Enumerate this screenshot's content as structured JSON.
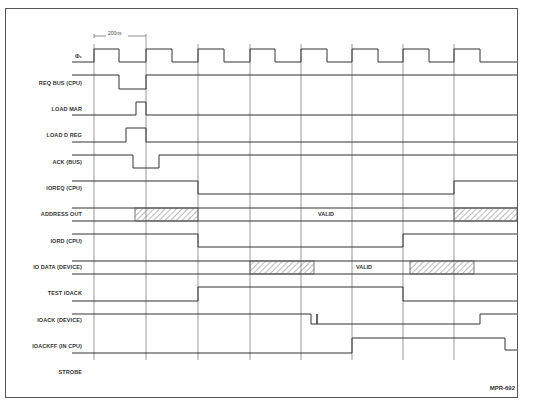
{
  "caption": "Timing diagram — I/O read cycle",
  "period_marker": "200ns",
  "figure_id": "MPR-692",
  "valid_label": "VALID",
  "signals": [
    {
      "name": "phi1",
      "label": "Φ₁"
    },
    {
      "name": "req-bus",
      "label": "REQ BUS (CPU)"
    },
    {
      "name": "load-mar",
      "label": "LOAD MAR"
    },
    {
      "name": "load-d-reg",
      "label": "LOAD D REG"
    },
    {
      "name": "ack-bus",
      "label": "ACK (BUS)"
    },
    {
      "name": "ioreq",
      "label": "IOREQ (CPU)"
    },
    {
      "name": "address-out",
      "label": "ADDRESS OUT"
    },
    {
      "name": "iord",
      "label": "IORD (CPU)"
    },
    {
      "name": "io-data",
      "label": "IO DATA (DEVICE)"
    },
    {
      "name": "test-ioack",
      "label": "TEST IOACK"
    },
    {
      "name": "ioack",
      "label": "IOACK (DEVICE)"
    },
    {
      "name": "ioackff",
      "label": "IOACKFF (IN CPU)"
    },
    {
      "name": "strobe",
      "label": "STROBE"
    }
  ],
  "colors": {
    "line": "#333333",
    "frame": "#555555",
    "hatch": "#777777"
  }
}
